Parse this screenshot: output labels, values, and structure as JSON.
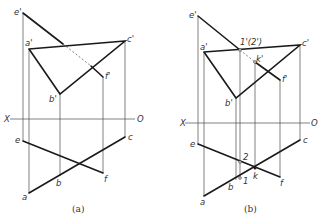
{
  "figure_a": {
    "caption": "(a)",
    "axis": {
      "left_label": "X",
      "right_label": "O"
    },
    "labels": {
      "e_prime": "e'",
      "a_prime": "a'",
      "c_prime": "c'",
      "f_prime": "f'",
      "b_prime": "b'",
      "e": "e",
      "a": "a",
      "b": "b",
      "c": "c",
      "f": "f"
    }
  },
  "figure_b": {
    "caption": "(b)",
    "axis": {
      "left_label": "X",
      "right_label": "O"
    },
    "labels": {
      "e_prime": "e'",
      "a_prime": "a'",
      "c_prime": "c'",
      "f_prime": "f'",
      "b_prime": "b'",
      "one_two_prime": "1'(2')",
      "k_prime": "k'",
      "e": "e",
      "a": "a",
      "b": "b",
      "c": "c",
      "f": "f",
      "k": "k",
      "one": "1",
      "two": "2"
    }
  }
}
